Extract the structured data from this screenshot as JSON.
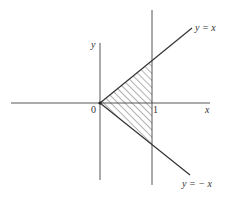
{
  "diagram": {
    "axes": {
      "x_label": "x",
      "y_label": "y"
    },
    "ticks": {
      "origin": "0",
      "x_one": "1"
    },
    "lines": [
      {
        "name": "y-equals-x",
        "label": "y = x"
      },
      {
        "name": "y-equals-neg-x",
        "label": "y = − x"
      },
      {
        "name": "x-equals-1",
        "label": ""
      }
    ],
    "shaded_region": {
      "vertices": [
        [
          0,
          0
        ],
        [
          1,
          1
        ],
        [
          1,
          -1
        ]
      ],
      "fill": "hatched"
    },
    "colors": {
      "line": "#333333",
      "hatch": "#555555",
      "background": "#ffffff"
    }
  }
}
